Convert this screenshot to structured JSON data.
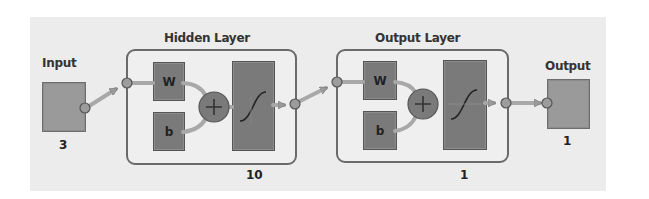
{
  "diagram": {
    "colors": {
      "background": "#ececec",
      "block": "#7a7a7a",
      "io_block": "#9a9a9a",
      "layer_border": "#6a6a6a",
      "wire": "#a8a8a8"
    },
    "input": {
      "label": "Input",
      "size": "3"
    },
    "layers": [
      {
        "label": "Hidden Layer",
        "weight_label": "W",
        "bias_label": "b",
        "sum_symbol": "+",
        "transfer": "sigmoid",
        "size": "10"
      },
      {
        "label": "Output Layer",
        "weight_label": "W",
        "bias_label": "b",
        "sum_symbol": "+",
        "transfer": "sigmoid",
        "size": "1"
      }
    ],
    "output": {
      "label": "Output",
      "size": "1"
    }
  }
}
